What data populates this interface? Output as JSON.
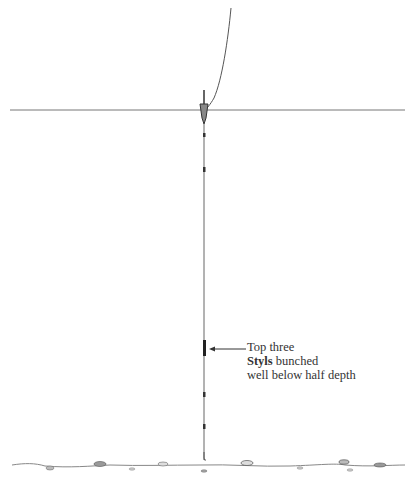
{
  "diagram": {
    "type": "fishing-rig-illustration",
    "elements": {
      "line_from_rod": "curved line",
      "water_surface": "horizontal line",
      "float": "pole float",
      "shot": "styl weights",
      "bottom": "lake bed"
    },
    "annotation": {
      "line1": "Top three",
      "line2_bold": "Styls",
      "line2_rest": " bunched",
      "line3": "well below half depth"
    },
    "colors": {
      "ink": "#444444",
      "surface": "#777777"
    }
  }
}
